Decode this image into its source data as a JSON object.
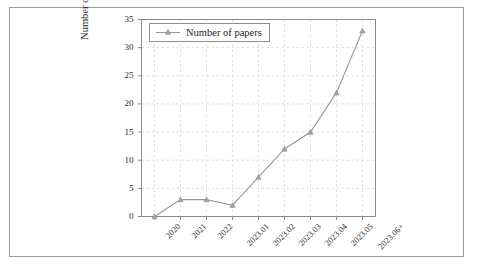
{
  "chart_data": {
    "type": "line",
    "title": "",
    "xlabel": "",
    "ylabel": "Number of papers",
    "categories": [
      "2020",
      "2021",
      "2022",
      "2023.01",
      "2023.02",
      "2023.03",
      "2023.04",
      "2023.05",
      "2023.06+"
    ],
    "values": [
      0,
      3,
      3,
      2,
      7,
      12,
      15,
      22,
      33
    ],
    "series": [
      {
        "name": "Number of papers",
        "values": [
          0,
          3,
          3,
          2,
          7,
          12,
          15,
          22,
          33
        ]
      }
    ],
    "ylim": [
      0,
      35
    ],
    "yticks": [
      0,
      5,
      10,
      15,
      20,
      25,
      30,
      35
    ],
    "ytick_labels": [
      "0",
      "5",
      "10",
      "15",
      "20",
      "25",
      "30",
      "35"
    ],
    "grid": true,
    "grid_style": "dashed",
    "legend_position": "upper left",
    "marker": "triangle",
    "line_color": "#8f9a9f",
    "marker_color": "#8f9a9f",
    "grid_color": "#d7d7d7",
    "axis_color": "#8a8a8a",
    "background": "#ffffff"
  },
  "legend": {
    "entries": [
      {
        "label": "Number of papers",
        "marker": "triangle-marker"
      }
    ]
  },
  "axes": {
    "y_title": "Number of papers"
  }
}
